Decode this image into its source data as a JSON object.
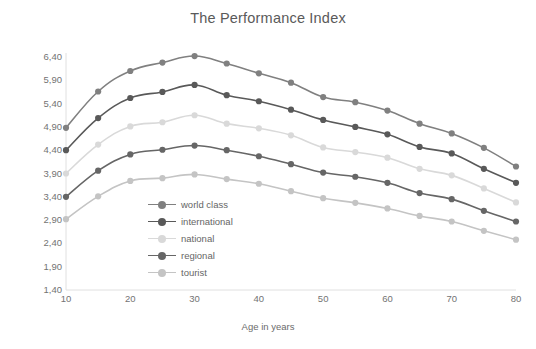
{
  "chart_data": {
    "type": "line",
    "title": "The Performance Index",
    "xlabel": "Age in years",
    "ylabel": "FTP in watts/kg",
    "x": [
      10,
      15,
      20,
      25,
      30,
      35,
      40,
      45,
      50,
      55,
      60,
      65,
      70,
      75,
      80
    ],
    "xlim": [
      10,
      80
    ],
    "ylim": [
      1.4,
      6.4
    ],
    "xticks": [
      10,
      20,
      30,
      40,
      50,
      60,
      70,
      80
    ],
    "xtick_labels": [
      "10",
      "20",
      "30",
      "40",
      "50",
      "60",
      "70",
      "80"
    ],
    "yticks": [
      1.4,
      1.9,
      2.4,
      2.9,
      3.4,
      3.9,
      4.4,
      4.9,
      5.4,
      5.9,
      6.4
    ],
    "ytick_labels": [
      "1,40",
      "1,90",
      "2,40",
      "2,90",
      "3,40",
      "3,90",
      "4,40",
      "4,90",
      "5,40",
      "5,90",
      "6,40"
    ],
    "grid": false,
    "legend_position": "inside-center-left",
    "series": [
      {
        "name": "world class",
        "color": "#808080",
        "values": [
          4.88,
          5.66,
          6.1,
          6.28,
          6.42,
          6.26,
          6.05,
          5.85,
          5.54,
          5.43,
          5.25,
          4.97,
          4.76,
          4.45,
          4.05
        ]
      },
      {
        "name": "international",
        "color": "#595959",
        "values": [
          4.4,
          5.09,
          5.52,
          5.65,
          5.8,
          5.58,
          5.45,
          5.27,
          5.05,
          4.9,
          4.74,
          4.47,
          4.33,
          4.0,
          3.7
        ]
      },
      {
        "name": "national",
        "color": "#d9d9d9",
        "values": [
          3.9,
          4.52,
          4.91,
          5.0,
          5.15,
          4.97,
          4.87,
          4.72,
          4.46,
          4.36,
          4.24,
          4.0,
          3.86,
          3.58,
          3.28
        ]
      },
      {
        "name": "regional",
        "color": "#666666",
        "values": [
          3.4,
          3.96,
          4.31,
          4.41,
          4.5,
          4.4,
          4.27,
          4.1,
          3.92,
          3.83,
          3.7,
          3.48,
          3.35,
          3.1,
          2.87
        ]
      },
      {
        "name": "tourist",
        "color": "#c4c4c4",
        "values": [
          2.92,
          3.41,
          3.74,
          3.8,
          3.88,
          3.78,
          3.68,
          3.52,
          3.37,
          3.27,
          3.15,
          2.99,
          2.87,
          2.67,
          2.48
        ]
      }
    ]
  },
  "legend": {
    "items": [
      {
        "label": "world class"
      },
      {
        "label": "international"
      },
      {
        "label": "national"
      },
      {
        "label": "regional"
      },
      {
        "label": "tourist"
      }
    ]
  }
}
